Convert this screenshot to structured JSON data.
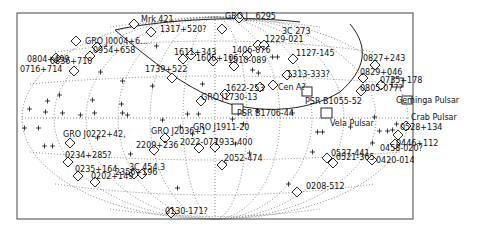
{
  "map": {
    "projection": "aitoff",
    "frame": {
      "x": 17,
      "y": 13,
      "w": 396,
      "h": 206
    },
    "center": {
      "x": 215,
      "y": 118
    },
    "radii": {
      "a": 193,
      "b": 101
    }
  },
  "pulsars": [
    {
      "label": "Geminga Pulsar",
      "x": 398,
      "y": 83,
      "lx": 405,
      "ly": 82
    },
    {
      "label": "Crab Pulsar",
      "x": 412,
      "y": 101,
      "lx": 418,
      "ly": 103
    },
    {
      "label": "Vela Pulsar",
      "x": 327,
      "y": 113,
      "lx": 330,
      "ly": 106
    },
    {
      "label": "PSR B1055-52",
      "x": 306,
      "y": 92,
      "lx": 305,
      "ly": 94
    },
    {
      "label": "PSR B1706-44",
      "x": 268,
      "y": 111,
      "lx": 235,
      "ly": 115
    },
    {
      "label": "PSR J1911-20"
    }
  ],
  "sources": [
    {
      "label": "Mrk 421",
      "x": 134,
      "y": 24,
      "lx": 140,
      "ly": 21
    },
    {
      "label": "1317+520?",
      "x": 150,
      "y": 32,
      "lx": 160,
      "ly": 30
    },
    {
      "label": "1633+382",
      "x": 222,
      "y": 29,
      "lx": 220,
      "ly": 23
    },
    {
      "label": "1229+021 / 0836+710 1622-253",
      "hidden": true
    },
    {
      "label": "GRO J...+6295",
      "x": 238,
      "y": 18,
      "lx": 225,
      "ly": 17
    },
    {
      "label": "3C 273",
      "x": 258,
      "y": 45,
      "lx": 288,
      "ly": 33
    },
    {
      "label": "3C 279",
      "x": 262,
      "y": 44,
      "lx": 263,
      "ly": 41
    },
    {
      "label": "1229-021",
      "x": 264,
      "y": 43,
      "lx": 270,
      "ly": 40
    },
    {
      "label": "1406-076",
      "x": 247,
      "y": 55,
      "lx": 230,
      "ly": 52
    },
    {
      "label": "1127-145",
      "x": 293,
      "y": 59,
      "lx": 292,
      "ly": 56
    },
    {
      "label": "1313-333?",
      "x": 287,
      "y": 73,
      "lx": 293,
      "ly": 76
    },
    {
      "label": "Cen A?",
      "x": 273,
      "y": 85,
      "lx": 281,
      "ly": 90
    },
    {
      "label": "1622-253",
      "x": 247,
      "y": 94,
      "lx": 228,
      "ly": 91
    },
    {
      "label": "GRO J1730-13",
      "x": 216,
      "y": 98,
      "lx": 200,
      "ly": 100
    },
    {
      "label": "1510-089",
      "x": 234,
      "y": 66,
      "lx": 226,
      "ly": 62
    },
    {
      "label": "1611+343",
      "x": 191,
      "y": 55,
      "lx": 180,
      "ly": 54
    },
    {
      "label": "1604+159",
      "x": 213,
      "y": 60,
      "lx": 212,
      "ly": 61
    },
    {
      "label": "1739+522",
      "x": 172,
      "y": 78,
      "lx": 143,
      "ly": 71
    },
    {
      "label": "1633+382",
      "x": 183,
      "y": 59,
      "lx": 172,
      "ly": 59
    },
    {
      "label": "0827+243",
      "x": 375,
      "y": 65,
      "lx": 371,
      "ly": 60
    },
    {
      "label": "0829+046",
      "x": 363,
      "y": 79,
      "lx": 360,
      "ly": 75
    },
    {
      "label": "0735+178",
      "x": 381,
      "y": 85,
      "lx": 380,
      "ly": 83
    },
    {
      "label": "0805-077?",
      "x": 361,
      "y": 91,
      "lx": 360,
      "ly": 90
    },
    {
      "label": "0528+134",
      "x": 406,
      "y": 126,
      "lx": 398,
      "ly": 130
    },
    {
      "label": "0446+112",
      "x": 398,
      "y": 135,
      "lx": 395,
      "ly": 143
    },
    {
      "label": "0458-020?",
      "x": 395,
      "y": 144,
      "lx": 380,
      "ly": 150
    },
    {
      "label": "0420-014",
      "x": 372,
      "y": 160,
      "lx": 374,
      "ly": 164
    },
    {
      "label": "0537-441",
      "x": 327,
      "y": 158,
      "lx": 332,
      "ly": 155
    },
    {
      "label": "0521-365",
      "x": 333,
      "y": 163,
      "lx": 337,
      "ly": 160
    },
    {
      "label": "0208-512",
      "x": 297,
      "y": 192,
      "lx": 307,
      "ly": 188
    },
    {
      "label": "2052-474",
      "x": 222,
      "y": 165,
      "lx": 224,
      "ly": 161
    },
    {
      "label": "1933-400",
      "x": 215,
      "y": 147,
      "lx": 220,
      "ly": 145
    },
    {
      "label": "2022-077",
      "x": 199,
      "y": 148,
      "lx": 180,
      "ly": 145
    },
    {
      "label": "GRO J2036+1",
      "x": 165,
      "y": 138,
      "lx": 145,
      "ly": 133
    },
    {
      "label": "2209+236",
      "x": 154,
      "y": 150,
      "lx": 156,
      "ly": 148
    },
    {
      "label": "CRO J0222+42",
      "x": 70,
      "y": 143,
      "lx": 66,
      "ly": 136
    },
    {
      "label": "0234+285?",
      "x": 68,
      "y": 162,
      "lx": 65,
      "ly": 159
    },
    {
      "label": "0235+164",
      "x": 78,
      "y": 176,
      "lx": 75,
      "ly": 172
    },
    {
      "label": "0202+149",
      "x": 95,
      "y": 182,
      "lx": 91,
      "ly": 180
    },
    {
      "label": "2356+196",
      "x": 134,
      "y": 174,
      "lx": 118,
      "ly": 174
    },
    {
      "label": "3C 454.3",
      "x": 142,
      "y": 174,
      "lx": 131,
      "ly": 169
    },
    {
      "label": "0130-171?",
      "x": 171,
      "y": 213,
      "lx": 165,
      "ly": 214
    },
    {
      "label": "GRO J0004+6...",
      "x": 76,
      "y": 41,
      "lx": 85,
      "ly": 43
    },
    {
      "label": "0954+658",
      "x": 97,
      "y": 47,
      "lx": 93,
      "ly": 52
    },
    {
      "label": "0804+499",
      "x": 56,
      "y": 58,
      "lx": 28,
      "ly": 61
    },
    {
      "label": "0836+710",
      "x": 90,
      "y": 56,
      "lx": 50,
      "ly": 63
    },
    {
      "label": "0716+714",
      "x": 74,
      "y": 71,
      "lx": 68,
      "ly": 70
    }
  ],
  "visible_labels": {
    "mrk421": "Mrk 421",
    "l1317": "1317+520?",
    "l6295": "GRO J...6295",
    "l1739": "1739+522",
    "l3c273": "3C 273",
    "l1229": "1229-021",
    "l1406": "1406-076",
    "l1127": "1127-145",
    "l1313": "1313-333?",
    "l1611": "1611+343",
    "l1604": "1606+106",
    "l1510": "1510-089",
    "l1622": "1622-253",
    "cenA": "Cen A?",
    "gro1730": "GRO J1730-13",
    "psr1706": "PSR B1706-44",
    "psr1055": "PSR B1055-52",
    "vela": "Vela Pulsar",
    "gro0004": "GRO J0004+6...",
    "l0954": "0954+658",
    "l0804": "0804+499",
    "l0836": "0836+710",
    "l0716": "0716+714",
    "l0827": "0827+243",
    "l0829": "0829+046",
    "l0735": "0735+178",
    "l0805": "0805-077?",
    "geminga": "Geminga Pulsar",
    "crab": "Crab Pulsar",
    "l0528": "0528+134",
    "l0446": "0446+112",
    "l0458": "0458-020?",
    "l0420": "0420-014",
    "l0537": "0537-441",
    "l0521": "0521-365",
    "gro0222": "GRO J0222+42,",
    "gro2036": "GRO J2036+1",
    "l2209": "2209+236",
    "gro1911": "GRO J1911-20",
    "l2022": "2022-077",
    "l1933": "1933-400",
    "l2052": "2052-474",
    "l0234": "0234+285?",
    "l0235": "0235+164",
    "l0202": "0202+149",
    "l2356": "2356+196",
    "l3c454": "3C 454.3",
    "l0208": "0208-512",
    "l0130": "0130-171?"
  }
}
